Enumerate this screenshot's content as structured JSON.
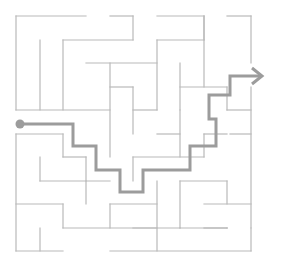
{
  "maze": {
    "width": 282,
    "height": 263,
    "colors": {
      "wall": "#b9b9b9",
      "path": "#9c9c9c",
      "background": "#ffffff"
    },
    "walls": [
      [
        16,
        16,
        86,
        16
      ],
      [
        110,
        16,
        133,
        16
      ],
      [
        133,
        16,
        133,
        40
      ],
      [
        16,
        16,
        16,
        110
      ],
      [
        40,
        40,
        40,
        110
      ],
      [
        63,
        40,
        133,
        40
      ],
      [
        63,
        40,
        63,
        110
      ],
      [
        86,
        63,
        157,
        63
      ],
      [
        110,
        63,
        110,
        157
      ],
      [
        110,
        87,
        133,
        87
      ],
      [
        16,
        110,
        110,
        110
      ],
      [
        157,
        16,
        204,
        16
      ],
      [
        204,
        16,
        204,
        87
      ],
      [
        227,
        16,
        251,
        16
      ],
      [
        251,
        16,
        251,
        63
      ],
      [
        157,
        40,
        204,
        40
      ],
      [
        157,
        40,
        157,
        110
      ],
      [
        180,
        63,
        180,
        110
      ],
      [
        180,
        87,
        227,
        87
      ],
      [
        204,
        40,
        204,
        16
      ],
      [
        133,
        87,
        133,
        134
      ],
      [
        133,
        110,
        157,
        110
      ],
      [
        180,
        110,
        180,
        157
      ],
      [
        157,
        134,
        180,
        134
      ],
      [
        133,
        157,
        204,
        157
      ],
      [
        204,
        134,
        204,
        157
      ],
      [
        227,
        87,
        227,
        110
      ],
      [
        227,
        110,
        251,
        110
      ],
      [
        251,
        87,
        251,
        228
      ],
      [
        230,
        134,
        251,
        134
      ],
      [
        204,
        134,
        227,
        134
      ],
      [
        16,
        134,
        63,
        134
      ],
      [
        16,
        134,
        16,
        251
      ],
      [
        63,
        134,
        63,
        157
      ],
      [
        63,
        157,
        86,
        157
      ],
      [
        86,
        157,
        86,
        181
      ],
      [
        40,
        157,
        40,
        181
      ],
      [
        40,
        181,
        110,
        181
      ],
      [
        16,
        204,
        63,
        204
      ],
      [
        63,
        204,
        63,
        228
      ],
      [
        63,
        228,
        157,
        228
      ],
      [
        40,
        228,
        40,
        251
      ],
      [
        16,
        251,
        63,
        251
      ],
      [
        110,
        204,
        110,
        228
      ],
      [
        110,
        204,
        157,
        204
      ],
      [
        157,
        181,
        157,
        251
      ],
      [
        180,
        181,
        227,
        181
      ],
      [
        180,
        181,
        180,
        228
      ],
      [
        180,
        228,
        227,
        228
      ],
      [
        227,
        181,
        227,
        204
      ],
      [
        204,
        204,
        251,
        204
      ],
      [
        133,
        157,
        133,
        181
      ],
      [
        204,
        228,
        227,
        228
      ],
      [
        227,
        228,
        227,
        228
      ],
      [
        251,
        228,
        251,
        251
      ],
      [
        110,
        251,
        251,
        251
      ],
      [
        86,
        181,
        86,
        204
      ],
      [
        133,
        228,
        180,
        228
      ]
    ],
    "solution_path": {
      "label": "solution",
      "start": [
        20,
        124
      ],
      "points": [
        [
          20,
          124
        ],
        [
          73,
          124
        ],
        [
          73,
          146
        ],
        [
          96,
          146
        ],
        [
          96,
          170
        ],
        [
          120,
          170
        ],
        [
          120,
          192
        ],
        [
          143,
          192
        ],
        [
          143,
          170
        ],
        [
          190,
          170
        ],
        [
          190,
          146
        ],
        [
          216,
          146
        ],
        [
          216,
          119
        ],
        [
          209,
          119
        ],
        [
          209,
          95
        ],
        [
          230,
          95
        ],
        [
          230,
          76
        ],
        [
          262,
          76
        ]
      ],
      "arrow_head": [
        [
          252,
          68
        ],
        [
          262,
          76
        ],
        [
          252,
          84
        ]
      ]
    }
  }
}
